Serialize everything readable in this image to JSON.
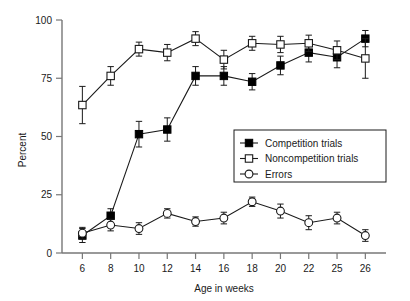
{
  "chart_data": {
    "type": "line",
    "title": "",
    "xlabel": "Age in weeks",
    "ylabel": "Percent",
    "categories": [
      "6",
      "8",
      "10",
      "12",
      "14",
      "16",
      "18",
      "20",
      "22",
      "25",
      "26"
    ],
    "x": [
      6,
      8,
      10,
      12,
      14,
      16,
      18,
      20,
      22,
      25,
      26
    ],
    "xlim": [
      0,
      10
    ],
    "ylim": [
      0,
      100
    ],
    "yticks": [
      0,
      25,
      50,
      75,
      100
    ],
    "ytick_labels": [
      "0",
      "25",
      "50",
      "75",
      "100"
    ],
    "grid": false,
    "legend_position": "center-right",
    "series": [
      {
        "name": "Competition trials",
        "marker": "filled-square",
        "values": [
          7.5,
          16.0,
          51.0,
          53.0,
          76.0,
          76.0,
          73.5,
          80.5,
          86.0,
          84.0,
          92.0
        ],
        "errors": [
          3.0,
          3.0,
          5.5,
          5.0,
          4.0,
          4.0,
          3.5,
          4.0,
          4.0,
          4.5,
          3.5
        ]
      },
      {
        "name": "Noncompetition trials",
        "marker": "open-square",
        "values": [
          63.5,
          76.0,
          87.5,
          86.0,
          92.0,
          83.0,
          90.0,
          89.5,
          90.0,
          87.0,
          83.5
        ],
        "errors": [
          8.0,
          4.0,
          3.0,
          3.5,
          3.0,
          4.0,
          3.0,
          3.5,
          3.5,
          4.0,
          8.5
        ]
      },
      {
        "name": "Errors",
        "marker": "open-circle",
        "values": [
          8.5,
          12.0,
          10.5,
          17.0,
          13.5,
          15.0,
          22.0,
          18.0,
          13.0,
          15.0,
          7.5
        ],
        "errors": [
          2.5,
          2.5,
          2.5,
          2.0,
          2.0,
          2.5,
          2.0,
          3.0,
          3.0,
          2.5,
          2.5
        ]
      }
    ]
  },
  "axes": {
    "y_title": "Percent",
    "x_title": "Age in weeks"
  },
  "legend": {
    "items": [
      {
        "label": "Competition trials",
        "marker": "filled-square"
      },
      {
        "label": "Noncompetition trials",
        "marker": "open-square"
      },
      {
        "label": "Errors",
        "marker": "open-circle"
      }
    ]
  },
  "colors": {
    "ink": "#1a1a1a",
    "axis": "#777777",
    "marker_fill_open": "#ffffff",
    "marker_fill_solid": "#000000",
    "background": "#ffffff"
  }
}
